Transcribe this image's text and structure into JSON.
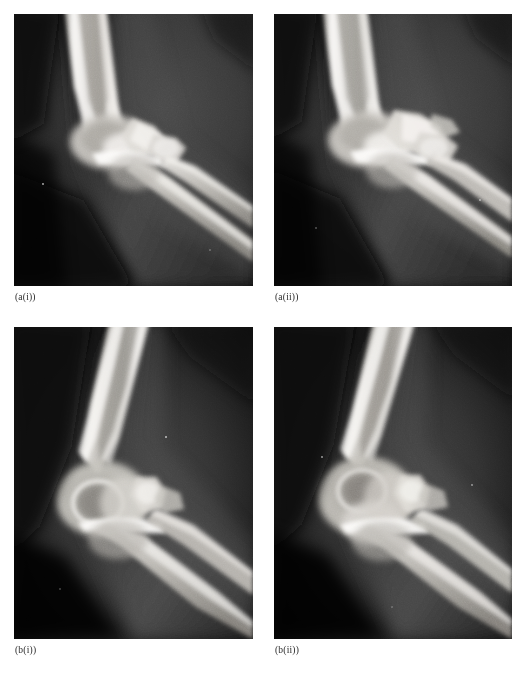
{
  "figure": {
    "kind": "radiograph-figure",
    "modality": "X-ray",
    "anatomy": "elbow",
    "projection": "lateral",
    "layout": "2x2 grid",
    "background_color": "#ffffff",
    "label_color": "#2a2a2a"
  },
  "panels": [
    {
      "id": "a-i",
      "label": "(a(i))",
      "position": "top-left",
      "description": "Lateral radiograph of the elbow in near full extension; distal humerus, olecranon, radial head and proximal ulna visible.",
      "colors": {
        "film_black": "#070707",
        "soft_tissue": "#3c3c3c",
        "bone_bright": "#f2f0ec",
        "bone_mid": "#b9b6b0"
      }
    },
    {
      "id": "a-ii",
      "label": "(a(ii))",
      "position": "top-right",
      "description": "Companion lateral radiograph of the same elbow at a slightly different rotation; radial head profile more prominent.",
      "colors": {
        "film_black": "#070707",
        "soft_tissue": "#3a3a3a",
        "bone_bright": "#f4f2ee",
        "bone_mid": "#bcb9b3"
      }
    },
    {
      "id": "b-i",
      "label": "(b(i))",
      "position": "bottom-left",
      "description": "Lateral radiograph of the elbow in flexion; capitellum and trochlea superimposed as a rounded lucency, forearm angled inferiorly to the right.",
      "colors": {
        "film_black": "#060606",
        "soft_tissue": "#353535",
        "bone_bright": "#f1efeb",
        "bone_mid": "#b5b2ac"
      }
    },
    {
      "id": "b-ii",
      "label": "(b(ii))",
      "position": "bottom-right",
      "description": "Companion flexed lateral radiograph of the same elbow; humeral condyles and olecranon overlap with the radial head laterally.",
      "colors": {
        "film_black": "#060606",
        "soft_tissue": "#343434",
        "bone_bright": "#f0eeea",
        "bone_mid": "#b4b1ab"
      }
    }
  ]
}
